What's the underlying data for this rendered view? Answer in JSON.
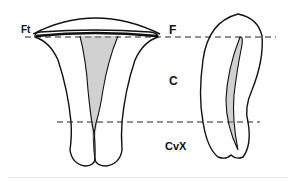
{
  "figure": {
    "type": "anatomical line drawing",
    "labels": {
      "ft": "Ft",
      "f": "F",
      "c": "C",
      "cvx": "CvX"
    },
    "colors": {
      "line": "#111111",
      "hatch": "#9a9a9a",
      "background": "#ffffff"
    }
  }
}
